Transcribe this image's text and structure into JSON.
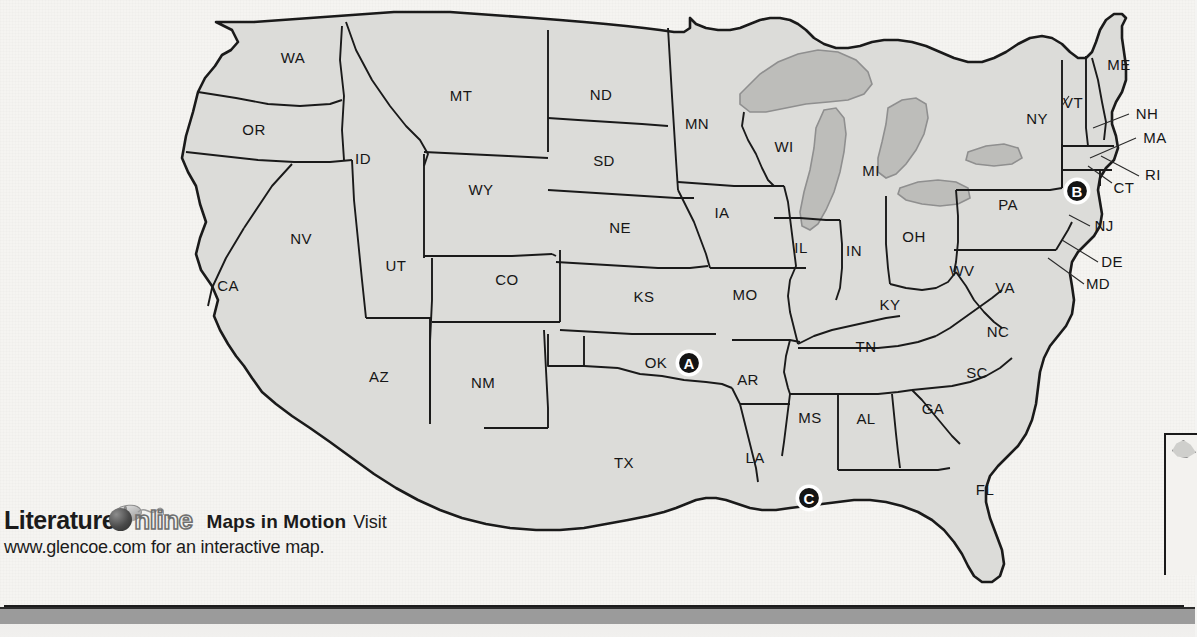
{
  "map": {
    "title_alt": "Map of the United States with state abbreviations",
    "colors": {
      "background": "#f5f4f1",
      "land_fill": "#dcdcd9",
      "land_stroke": "#1a1a1a",
      "lake_fill": "#bdbdba",
      "lake_stroke": "#8d8d8d",
      "label_color": "#161616",
      "marker_fill": "#141414",
      "marker_text": "#ffffff",
      "bottom_bar": "#9b9b9b"
    },
    "state_labels": [
      {
        "abbr": "WA",
        "x": 293,
        "y": 59
      },
      {
        "abbr": "OR",
        "x": 254,
        "y": 131
      },
      {
        "abbr": "CA",
        "x": 228,
        "y": 287
      },
      {
        "abbr": "NV",
        "x": 301,
        "y": 240
      },
      {
        "abbr": "ID",
        "x": 363,
        "y": 160
      },
      {
        "abbr": "MT",
        "x": 461,
        "y": 97
      },
      {
        "abbr": "WY",
        "x": 481,
        "y": 191
      },
      {
        "abbr": "UT",
        "x": 396,
        "y": 267
      },
      {
        "abbr": "AZ",
        "x": 379,
        "y": 378
      },
      {
        "abbr": "CO",
        "x": 507,
        "y": 281
      },
      {
        "abbr": "NM",
        "x": 483,
        "y": 384
      },
      {
        "abbr": "TX",
        "x": 624,
        "y": 464
      },
      {
        "abbr": "ND",
        "x": 601,
        "y": 96
      },
      {
        "abbr": "SD",
        "x": 604,
        "y": 162
      },
      {
        "abbr": "NE",
        "x": 620,
        "y": 229
      },
      {
        "abbr": "KS",
        "x": 644,
        "y": 298
      },
      {
        "abbr": "OK",
        "x": 656,
        "y": 364
      },
      {
        "abbr": "MN",
        "x": 697,
        "y": 125
      },
      {
        "abbr": "IA",
        "x": 722,
        "y": 214
      },
      {
        "abbr": "MO",
        "x": 745,
        "y": 296
      },
      {
        "abbr": "AR",
        "x": 748,
        "y": 381
      },
      {
        "abbr": "LA",
        "x": 755,
        "y": 459
      },
      {
        "abbr": "WI",
        "x": 784,
        "y": 148
      },
      {
        "abbr": "IL",
        "x": 801,
        "y": 249
      },
      {
        "abbr": "MS",
        "x": 810,
        "y": 419
      },
      {
        "abbr": "MI",
        "x": 871,
        "y": 172
      },
      {
        "abbr": "IN",
        "x": 854,
        "y": 252
      },
      {
        "abbr": "KY",
        "x": 890,
        "y": 306
      },
      {
        "abbr": "TN",
        "x": 866,
        "y": 348
      },
      {
        "abbr": "AL",
        "x": 866,
        "y": 420
      },
      {
        "abbr": "OH",
        "x": 914,
        "y": 238
      },
      {
        "abbr": "WV",
        "x": 962,
        "y": 272
      },
      {
        "abbr": "GA",
        "x": 933,
        "y": 410
      },
      {
        "abbr": "SC",
        "x": 977,
        "y": 374
      },
      {
        "abbr": "NC",
        "x": 998,
        "y": 333
      },
      {
        "abbr": "VA",
        "x": 1005,
        "y": 289
      },
      {
        "abbr": "PA",
        "x": 1008,
        "y": 206
      },
      {
        "abbr": "NY",
        "x": 1037,
        "y": 120
      },
      {
        "abbr": "FL",
        "x": 985,
        "y": 491
      },
      {
        "abbr": "ME",
        "x": 1119,
        "y": 66
      },
      {
        "abbr": "VT",
        "x": 1073,
        "y": 104
      },
      {
        "abbr": "NH",
        "x": 1147,
        "y": 115
      },
      {
        "abbr": "MA",
        "x": 1155,
        "y": 139
      },
      {
        "abbr": "RI",
        "x": 1153,
        "y": 176
      },
      {
        "abbr": "CT",
        "x": 1124,
        "y": 189
      },
      {
        "abbr": "NJ",
        "x": 1104,
        "y": 227
      },
      {
        "abbr": "DE",
        "x": 1112,
        "y": 263
      },
      {
        "abbr": "MD",
        "x": 1098,
        "y": 285
      }
    ],
    "markers": [
      {
        "id": "A",
        "label": "A",
        "x": 689,
        "y": 363
      },
      {
        "id": "B",
        "label": "B",
        "x": 1077,
        "y": 191
      },
      {
        "id": "C",
        "label": "C",
        "x": 809,
        "y": 498
      }
    ]
  },
  "footer": {
    "brand_literature": "Literature",
    "brand_online": "nline",
    "feature": "Maps in Motion",
    "visit": "Visit",
    "url": "www.glencoe.com",
    "instruction": "for an interactive map."
  }
}
